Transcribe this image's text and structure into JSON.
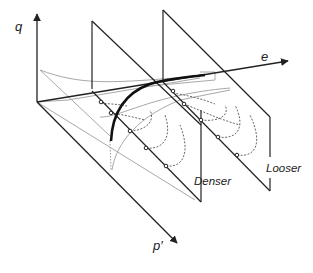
{
  "figure": {
    "type": "3D critical state / state boundary surface diagram",
    "axes": {
      "q": "q",
      "e": "e",
      "p": "p′"
    },
    "planes": [
      {
        "label": "Denser"
      },
      {
        "label": "Looser"
      }
    ],
    "colors": {
      "axis": "#222222",
      "csl": "#111111",
      "grey": "#a8a8a8",
      "dashed": "#555555"
    }
  }
}
